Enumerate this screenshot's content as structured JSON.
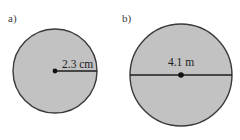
{
  "figure": {
    "background_color": "#ffffff",
    "circle_fill_color": "#c2c2c2",
    "circle_stroke_color": "#3a3a3a",
    "line_color": "#1c1c1c",
    "label_color": "#3b3b3b",
    "parts": [
      {
        "id": "a",
        "label": "a)",
        "shape": "circle",
        "measure_type": "radius",
        "measure_label": "2.3 cm",
        "measure_value": 2.3,
        "measure_unit": "cm",
        "center_x": 55,
        "center_y": 71,
        "radius_px": 42,
        "label_x": 8,
        "label_y": 22,
        "measure_label_x": 62,
        "measure_label_y": 68
      },
      {
        "id": "b",
        "label": "b)",
        "shape": "circle",
        "measure_type": "diameter",
        "measure_label": "4.1 m",
        "measure_value": 4.1,
        "measure_unit": "m",
        "center_x": 181,
        "center_y": 75,
        "radius_px": 51,
        "label_x": 122,
        "label_y": 22,
        "measure_label_x": 181,
        "measure_label_y": 66
      }
    ]
  }
}
